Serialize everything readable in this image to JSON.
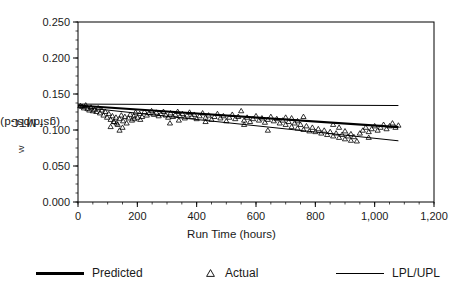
{
  "chart_data": {
    "type": "scatter",
    "title": "",
    "xlabel": "Run Time (hours)",
    "ylabel": "MTC_w (gsfd/psi-d)",
    "ylabel_main": "MTC",
    "ylabel_sub": "W",
    "ylabel_units": " (gsfd/psi-d)",
    "xlim": [
      0,
      1200
    ],
    "ylim": [
      0,
      0.25
    ],
    "xticks": [
      0,
      200,
      400,
      600,
      800,
      1000,
      1200
    ],
    "xtick_labels": [
      "0",
      "200",
      "400",
      "600",
      "800",
      "1,000",
      "1,200"
    ],
    "yticks": [
      0.0,
      0.05,
      0.1,
      0.15,
      0.2,
      0.25
    ],
    "ytick_labels": [
      "0.000",
      "0.050",
      "0.100",
      "0.150",
      "0.200",
      "0.250"
    ],
    "x_minor_tick_interval": 50,
    "y_minor_tick_interval": 0.0125,
    "grid": false,
    "legend_position": "below-plot",
    "series": [
      {
        "name": "Predicted",
        "type": "line",
        "style": "thick-solid",
        "color": "#000000",
        "x": [
          0,
          1080
        ],
        "values": [
          0.134,
          0.104
        ]
      },
      {
        "name": "UPL",
        "type": "line",
        "style": "thin-solid",
        "color": "#000000",
        "x": [
          0,
          1080
        ],
        "values": [
          0.136,
          0.134
        ]
      },
      {
        "name": "LPL",
        "type": "line",
        "style": "thin-solid",
        "color": "#000000",
        "x": [
          0,
          1080
        ],
        "values": [
          0.132,
          0.085
        ]
      },
      {
        "name": "Actual",
        "type": "scatter",
        "marker": "triangle-up-open",
        "color": "#000000",
        "points": [
          [
            8,
            0.134
          ],
          [
            14,
            0.133
          ],
          [
            20,
            0.131
          ],
          [
            26,
            0.135
          ],
          [
            32,
            0.13
          ],
          [
            38,
            0.128
          ],
          [
            44,
            0.132
          ],
          [
            50,
            0.127
          ],
          [
            56,
            0.129
          ],
          [
            62,
            0.126
          ],
          [
            68,
            0.131
          ],
          [
            74,
            0.124
          ],
          [
            80,
            0.128
          ],
          [
            86,
            0.121
          ],
          [
            92,
            0.126
          ],
          [
            98,
            0.118
          ],
          [
            104,
            0.123
          ],
          [
            110,
            0.115
          ],
          [
            116,
            0.12
          ],
          [
            122,
            0.112
          ],
          [
            128,
            0.118
          ],
          [
            134,
            0.108
          ],
          [
            140,
            0.116
          ],
          [
            146,
            0.121
          ],
          [
            152,
            0.113
          ],
          [
            158,
            0.119
          ],
          [
            164,
            0.11
          ],
          [
            170,
            0.117
          ],
          [
            176,
            0.122
          ],
          [
            182,
            0.114
          ],
          [
            188,
            0.12
          ],
          [
            194,
            0.125
          ],
          [
            200,
            0.118
          ],
          [
            208,
            0.123
          ],
          [
            216,
            0.119
          ],
          [
            224,
            0.126
          ],
          [
            232,
            0.121
          ],
          [
            240,
            0.124
          ],
          [
            248,
            0.127
          ],
          [
            256,
            0.122
          ],
          [
            264,
            0.125
          ],
          [
            272,
            0.12
          ],
          [
            280,
            0.123
          ],
          [
            288,
            0.126
          ],
          [
            296,
            0.121
          ],
          [
            304,
            0.118
          ],
          [
            312,
            0.124
          ],
          [
            320,
            0.119
          ],
          [
            328,
            0.122
          ],
          [
            336,
            0.126
          ],
          [
            344,
            0.12
          ],
          [
            352,
            0.123
          ],
          [
            360,
            0.117
          ],
          [
            368,
            0.121
          ],
          [
            376,
            0.125
          ],
          [
            384,
            0.119
          ],
          [
            392,
            0.122
          ],
          [
            400,
            0.116
          ],
          [
            410,
            0.12
          ],
          [
            420,
            0.124
          ],
          [
            430,
            0.118
          ],
          [
            440,
            0.121
          ],
          [
            450,
            0.115
          ],
          [
            460,
            0.119
          ],
          [
            470,
            0.123
          ],
          [
            480,
            0.117
          ],
          [
            490,
            0.12
          ],
          [
            500,
            0.113
          ],
          [
            510,
            0.118
          ],
          [
            520,
            0.122
          ],
          [
            530,
            0.116
          ],
          [
            540,
            0.119
          ],
          [
            550,
            0.127
          ],
          [
            560,
            0.114
          ],
          [
            570,
            0.118
          ],
          [
            580,
            0.112
          ],
          [
            590,
            0.116
          ],
          [
            600,
            0.12
          ],
          [
            610,
            0.114
          ],
          [
            620,
            0.117
          ],
          [
            630,
            0.111
          ],
          [
            640,
            0.115
          ],
          [
            650,
            0.119
          ],
          [
            660,
            0.113
          ],
          [
            670,
            0.116
          ],
          [
            680,
            0.11
          ],
          [
            690,
            0.114
          ],
          [
            700,
            0.108
          ],
          [
            710,
            0.112
          ],
          [
            720,
            0.105
          ],
          [
            730,
            0.11
          ],
          [
            740,
            0.103
          ],
          [
            750,
            0.108
          ],
          [
            760,
            0.101
          ],
          [
            770,
            0.106
          ],
          [
            780,
            0.099
          ],
          [
            790,
            0.104
          ],
          [
            800,
            0.098
          ],
          [
            810,
            0.102
          ],
          [
            820,
            0.096
          ],
          [
            830,
            0.1
          ],
          [
            840,
            0.094
          ],
          [
            850,
            0.098
          ],
          [
            860,
            0.092
          ],
          [
            870,
            0.096
          ],
          [
            880,
            0.09
          ],
          [
            890,
            0.094
          ],
          [
            900,
            0.088
          ],
          [
            910,
            0.092
          ],
          [
            920,
            0.086
          ],
          [
            930,
            0.091
          ],
          [
            940,
            0.085
          ],
          [
            950,
            0.096
          ],
          [
            960,
            0.1
          ],
          [
            970,
            0.104
          ],
          [
            980,
            0.098
          ],
          [
            990,
            0.102
          ],
          [
            1000,
            0.106
          ],
          [
            1010,
            0.1
          ],
          [
            1020,
            0.104
          ],
          [
            1030,
            0.108
          ],
          [
            1040,
            0.102
          ],
          [
            1050,
            0.106
          ],
          [
            1060,
            0.11
          ],
          [
            1070,
            0.104
          ],
          [
            1080,
            0.107
          ],
          [
            110,
            0.105
          ],
          [
            140,
            0.1
          ],
          [
            150,
            0.104
          ],
          [
            310,
            0.11
          ],
          [
            560,
            0.108
          ],
          [
            640,
            0.1
          ],
          [
            980,
            0.09
          ],
          [
            120,
            0.112
          ],
          [
            130,
            0.11
          ],
          [
            190,
            0.116
          ],
          [
            210,
            0.115
          ],
          [
            340,
            0.114
          ],
          [
            430,
            0.112
          ],
          [
            700,
            0.118
          ],
          [
            720,
            0.117
          ],
          [
            740,
            0.113
          ],
          [
            760,
            0.119
          ],
          [
            860,
            0.108
          ],
          [
            880,
            0.104
          ],
          [
            900,
            0.099
          ],
          [
            920,
            0.095
          ]
        ]
      }
    ]
  },
  "legend": {
    "items": [
      {
        "label": "Predicted",
        "marker": "thick-line"
      },
      {
        "label": "Actual",
        "marker": "triangle"
      },
      {
        "label": "LPL/UPL",
        "marker": "thin-line"
      }
    ]
  }
}
